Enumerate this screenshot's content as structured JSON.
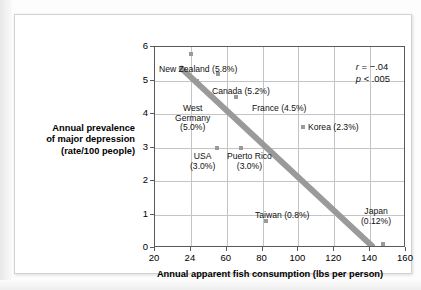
{
  "chart_data": {
    "type": "scatter",
    "title": "",
    "xlabel": "Annual apparent fish consumption (lbs per person)",
    "ylabel": "Annual prevalence of major depression (rate/100 people)",
    "ylabel_lines": [
      "Annual prevalence",
      "of major depression",
      "(rate/100 people)"
    ],
    "xlim": [
      20,
      160
    ],
    "ylim": [
      0,
      6
    ],
    "xticks": [
      "20",
      "24",
      "60",
      "80",
      "100",
      "120",
      "140",
      "160"
    ],
    "yticks": [
      "0",
      "1",
      "2",
      "3",
      "4",
      "5",
      "6"
    ],
    "grid": true,
    "legend": "none",
    "annotations": {
      "r_symbol": "r",
      "r_text": " = −.04",
      "p_symbol": "p",
      "p_text": " < .005"
    },
    "points": [
      {
        "name": "New Zealand",
        "label": "New Zealand (5.8%)",
        "x": 24.5,
        "y": 5.8,
        "rate_percent": "5.8%"
      },
      {
        "name": "Canada",
        "label": "Canada (5.2%)",
        "x": 51,
        "y": 5.2,
        "rate_percent": "5.2%"
      },
      {
        "name": "West Germany",
        "label": "West Germany (5.0%)",
        "x": 30,
        "y": 5.0,
        "rate_percent": "5.0%"
      },
      {
        "name": "France",
        "label": "France (4.5%)",
        "x": 65,
        "y": 4.5,
        "rate_percent": "4.5%"
      },
      {
        "name": "USA",
        "label": "USA (3.0%)",
        "x": 50,
        "y": 3.0,
        "rate_percent": "3.0%"
      },
      {
        "name": "Puerto Rico",
        "label": "Puerto Rico (3.0%)",
        "x": 68,
        "y": 3.0,
        "rate_percent": "3.0%"
      },
      {
        "name": "Korea",
        "label": "Korea (2.3%)",
        "x": 107,
        "y": 2.3,
        "rate_percent": "2.3%"
      },
      {
        "name": "Taiwan",
        "label": "Taiwan (0.8%)",
        "x": 82,
        "y": 0.8,
        "rate_percent": "0.8%"
      },
      {
        "name": "Japan",
        "label": "Japan (0.12%)",
        "x": 147,
        "y": 0.12,
        "rate_percent": "0.12%"
      }
    ],
    "trendline": {
      "from": [
        23,
        5.35
      ],
      "to": [
        142,
        0.0
      ],
      "color": "#9a9a9a"
    }
  },
  "labels": {
    "new_zealand": "New Zealand (5.8%)",
    "canada": "Canada (5.2%)",
    "west_germany": "West\nGermany\n(5.0%)",
    "france": "France (4.5%)",
    "usa": "USA\n(3.0%)",
    "puerto_rico": "Puerto Rico\n(3.0%)",
    "korea": "Korea (2.3%)",
    "taiwan": "Taiwan (0.8%)",
    "japan": "Japan\n(0.12%)"
  },
  "colors": {
    "marker": "#9a9a9a",
    "trendline": "#9a9a9a",
    "grid": "#c4c4c4",
    "axis": "#5a5a5a",
    "text": "#111111",
    "card": "#ffffff"
  }
}
